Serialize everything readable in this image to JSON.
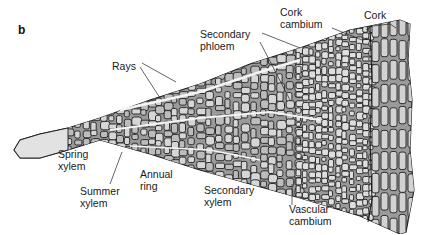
{
  "figure": {
    "panel_letter": "b",
    "labels": [
      {
        "id": "rays",
        "lines": [
          "Rays"
        ]
      },
      {
        "id": "secondary-phloem",
        "lines": [
          "Secondary",
          "phloem"
        ]
      },
      {
        "id": "cork-cambium",
        "lines": [
          "Cork",
          "cambium"
        ]
      },
      {
        "id": "cork",
        "lines": [
          "Cork"
        ]
      },
      {
        "id": "spring-xylem",
        "lines": [
          "Spring",
          "xylem"
        ]
      },
      {
        "id": "summer-xylem",
        "lines": [
          "Summer",
          "xylem"
        ]
      },
      {
        "id": "annual-ring",
        "lines": [
          "Annual",
          "ring"
        ]
      },
      {
        "id": "secondary-xylem",
        "lines": [
          "Secondary",
          "xylem"
        ]
      },
      {
        "id": "vascular-cambium",
        "lines": [
          "Vascular",
          "cambium"
        ]
      }
    ]
  }
}
